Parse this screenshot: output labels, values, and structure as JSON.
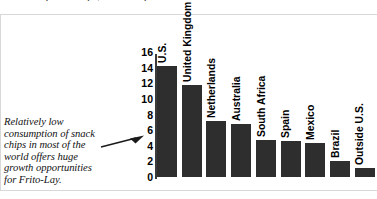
{
  "top_clipped_text": "includes potato chips, tortilla chips and snack nuts inside and outside the U.S.",
  "caption": {
    "lines": [
      "Relatively low",
      "consumption of snack",
      "chips in most of the",
      "world offers huge",
      "growth opportunities",
      "for Frito-Lay."
    ],
    "full_text": "Relatively low consumption of snack chips in most of the world offers huge growth opportunities for Frito-Lay."
  },
  "arrow": {
    "icon": "arrow-right-icon",
    "direction": "right"
  },
  "colors": {
    "bar_fill": "#2e2e2e",
    "axis": "#3b3b3b",
    "text": "#000000",
    "background": "#ffffff"
  },
  "chart_data": {
    "type": "bar",
    "title": "",
    "subtitle": "",
    "xlabel": "",
    "ylabel": "",
    "ylim": [
      0,
      16
    ],
    "yticks": [
      0,
      2,
      4,
      6,
      8,
      10,
      12,
      14,
      16
    ],
    "ytick_labels": [
      "0",
      "2",
      "4",
      "6",
      "8",
      "10",
      "12",
      "14",
      "16"
    ],
    "grid": false,
    "legend": false,
    "orientation": "vertical",
    "category_label_rotation": -90,
    "categories": [
      "U.S.",
      "United Kingdom",
      "Netherlands",
      "Australia",
      "South Africa",
      "Spain",
      "Mexico",
      "Brazil",
      "Outside U.S."
    ],
    "values": [
      14.2,
      11.8,
      7.2,
      6.8,
      4.8,
      4.6,
      4.3,
      2.0,
      1.2
    ]
  }
}
